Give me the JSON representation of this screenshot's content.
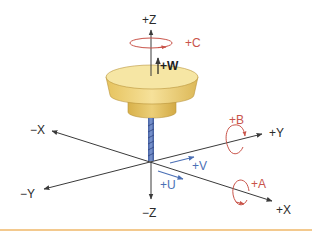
{
  "diagram": {
    "type": "machine-axis-coordinate-system",
    "linear_axes": {
      "x_pos": "+X",
      "x_neg": "−X",
      "y_pos": "+Y",
      "y_neg": "−Y",
      "z_pos": "+Z",
      "z_neg": "−Z"
    },
    "rotary_axes": {
      "a": "+A",
      "b": "+B",
      "c": "+C"
    },
    "secondary_linear_axes": {
      "u": "+U",
      "v": "+V",
      "w": "+W"
    },
    "colors": {
      "axis_line": "#3a3a3a",
      "rotary": "#c9544a",
      "secondary": "#4a6fb5",
      "spindle_body": "#f0d77e",
      "spindle_shade": "#d9b552",
      "tool": "#5d78b8",
      "rule": "#f3c98e"
    }
  }
}
